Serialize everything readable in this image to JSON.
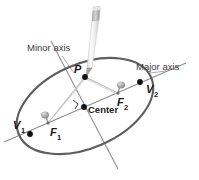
{
  "figure": {
    "background_color": "#ffffff",
    "width": 199,
    "height": 180
  },
  "colors": {
    "ellipse_stroke": "#5a5a5a",
    "axis_line": "#8a8a8a",
    "string_line": "#b0b0b0",
    "point_fill": "#111111",
    "pin_body": "#9a9a9a",
    "pin_highlight": "#cfcfcf",
    "pencil_body": "#f2f2f2",
    "pencil_band": "#b8b8b8",
    "pencil_tip": "#9c9c9c",
    "label_text": "#3b3b3b",
    "label_text_dark": "#1a1a1a"
  },
  "labels": {
    "minor_axis": "Minor axis",
    "major_axis": "Major axis",
    "center": "Center",
    "point_p": "P",
    "vertex_1": "V",
    "vertex_1_sub": "1",
    "vertex_2": "V",
    "vertex_2_sub": "2",
    "focus_1": "F",
    "focus_1_sub": "1",
    "focus_2": "F",
    "focus_2_sub": "2"
  },
  "geometry": {
    "ellipse": {
      "center_x": 85,
      "center_y": 106,
      "radius_x": 72,
      "radius_y": 42,
      "rotation_deg": -22
    },
    "points": {
      "P": {
        "x": 85,
        "y": 77
      },
      "V1": {
        "x": 30,
        "y": 133
      },
      "V2": {
        "x": 140,
        "y": 82
      },
      "F1": {
        "x": 48,
        "y": 123
      },
      "F2": {
        "x": 118,
        "y": 93
      },
      "center": {
        "x": 84,
        "y": 107
      }
    },
    "major_axis_line": {
      "x1": 4,
      "y1": 142,
      "x2": 184,
      "y2": 64
    },
    "minor_axis_line": {
      "x1": 52,
      "y1": 42,
      "x2": 117,
      "y2": 168
    },
    "pencil": {
      "tip_x": 86,
      "tip_y": 76,
      "top_x": 98,
      "top_y": 9
    }
  }
}
